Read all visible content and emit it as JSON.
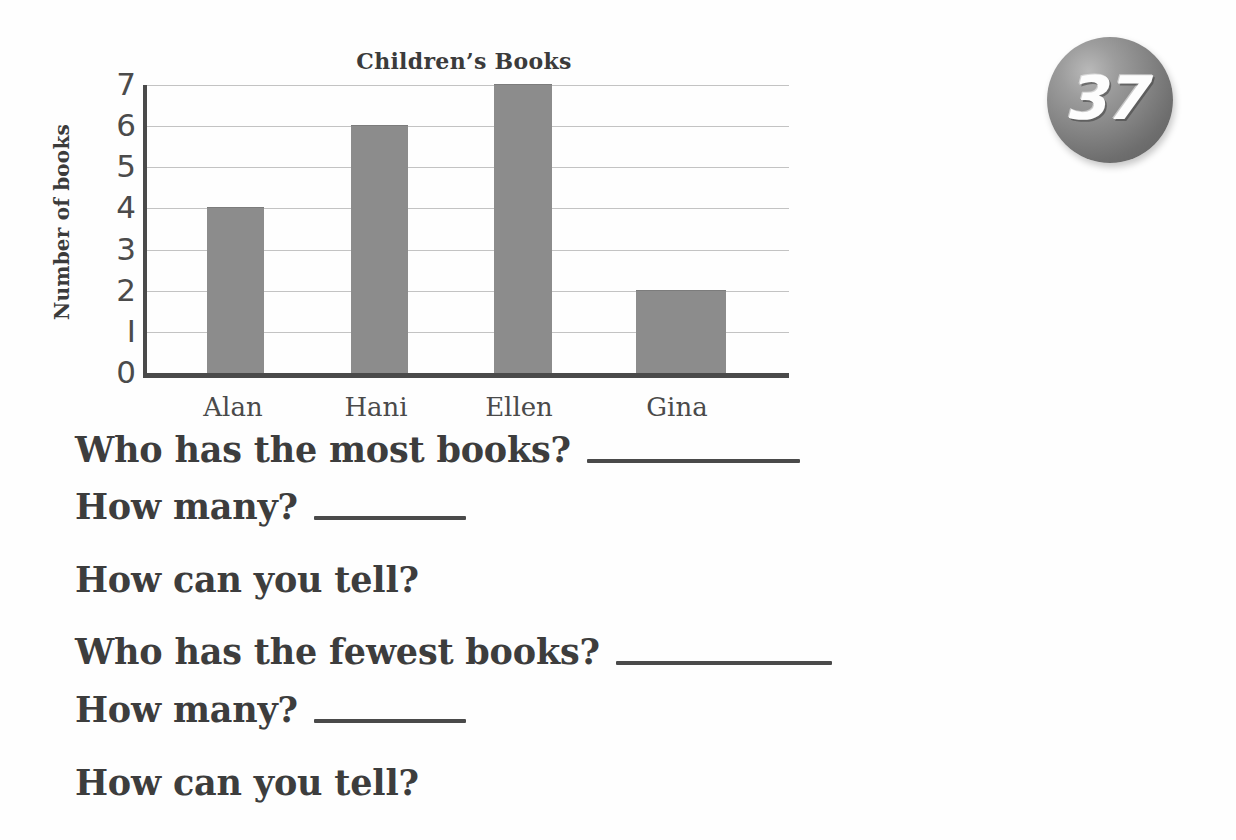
{
  "page": {
    "number_badge": "37",
    "badge_icon": "sphere-badge-icon"
  },
  "chart_data": {
    "type": "bar",
    "title": "Children’s Books",
    "xlabel": "",
    "ylabel": "Number of books",
    "categories": [
      "Alan",
      "Hani",
      "Ellen",
      "Gina"
    ],
    "values": [
      4,
      6,
      7,
      2
    ],
    "ylim": [
      0,
      7
    ],
    "yticks": [
      "0",
      "1",
      "2",
      "3",
      "4",
      "5",
      "6",
      "7"
    ],
    "grid": true,
    "legend": "none",
    "bar_color": "#8c8c8c",
    "axis_color": "#4a4a4a",
    "gridline_color": "#c3c3c3"
  },
  "questions": [
    {
      "text": "Who has the most books?",
      "blank_width": 213
    },
    {
      "text": "How many?",
      "blank_width": 152
    },
    {
      "text": "How can you tell?",
      "blank_width": 0
    },
    {
      "text": "Who has the fewest books?",
      "blank_width": 216
    },
    {
      "text": "How many?",
      "blank_width": 152
    },
    {
      "text": "How can you tell?",
      "blank_width": 0
    }
  ]
}
